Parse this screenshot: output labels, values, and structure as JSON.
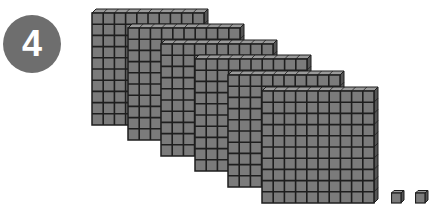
{
  "badge": {
    "label": "4",
    "color": "#6e6e6e"
  },
  "model": {
    "description": "Base-ten blocks: 6 hundreds flats and 2 unit cubes",
    "flats": [
      {
        "x": 92,
        "y": 13,
        "rows": 10,
        "cols": 10
      },
      {
        "x": 128,
        "y": 28,
        "rows": 10,
        "cols": 10
      },
      {
        "x": 161,
        "y": 44,
        "rows": 10,
        "cols": 10
      },
      {
        "x": 195,
        "y": 59,
        "rows": 10,
        "cols": 10
      },
      {
        "x": 228,
        "y": 75,
        "rows": 10,
        "cols": 10
      },
      {
        "x": 262,
        "y": 91,
        "rows": 10,
        "cols": 10
      }
    ],
    "units": [
      {
        "x": 391,
        "y": 193
      },
      {
        "x": 415,
        "y": 193
      }
    ],
    "flat_count": 6,
    "unit_count": 2,
    "colors": {
      "face": "#7b7b7b",
      "top": "#9a9a9a",
      "side": "#555555",
      "grid": "#1e1e1e"
    }
  }
}
